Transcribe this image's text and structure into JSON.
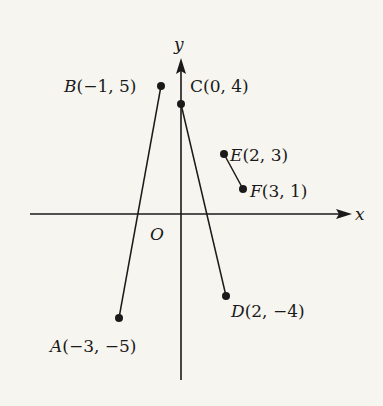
{
  "diagram": {
    "axes": {
      "x_label": "x",
      "y_label": "y",
      "origin_label": "O"
    },
    "points": [
      {
        "name": "A",
        "coords": "(−3, −5)",
        "x": -3,
        "y": -5
      },
      {
        "name": "B",
        "coords": "(−1, 5)",
        "x": -1,
        "y": 5
      },
      {
        "name": "C",
        "coords": "(0, 4)",
        "x": 0,
        "y": 4
      },
      {
        "name": "D",
        "coords": "(2, −4)",
        "x": 2,
        "y": -4
      },
      {
        "name": "E",
        "coords": "(2, 3)",
        "x": 2,
        "y": 3
      },
      {
        "name": "F",
        "coords": "(3, 1)",
        "x": 3,
        "y": 1
      }
    ],
    "segments": [
      {
        "from": "A",
        "to": "B"
      },
      {
        "from": "C",
        "to": "D"
      },
      {
        "from": "E",
        "to": "F"
      }
    ],
    "colors": {
      "background": "#f7f5ef",
      "ink": "#1a1a1a"
    }
  }
}
